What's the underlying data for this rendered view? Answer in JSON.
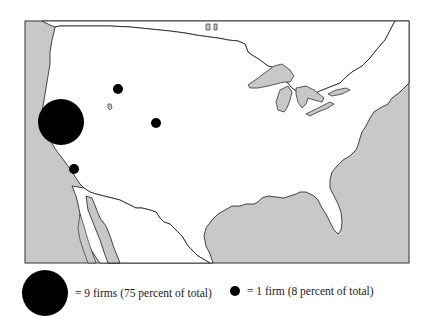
{
  "map": {
    "colors": {
      "water": "#c8c8c8",
      "land": "#ffffff",
      "outline": "#1a1a1a",
      "marker": "#000000"
    },
    "markers": [
      {
        "label": "9 firms",
        "cx": 61,
        "cy": 122,
        "r": 23
      },
      {
        "label": "1 firm",
        "cx": 118,
        "cy": 89,
        "r": 5
      },
      {
        "label": "1 firm",
        "cx": 156,
        "cy": 123,
        "r": 5
      },
      {
        "label": "1 firm",
        "cx": 74,
        "cy": 169,
        "r": 5
      }
    ]
  },
  "legend": {
    "large": {
      "text": "= 9 firms (75 percent of total)",
      "firms": 9,
      "percent": 75
    },
    "small": {
      "text": "= 1 firm (8 percent of total)",
      "firms": 1,
      "percent": 8
    }
  }
}
